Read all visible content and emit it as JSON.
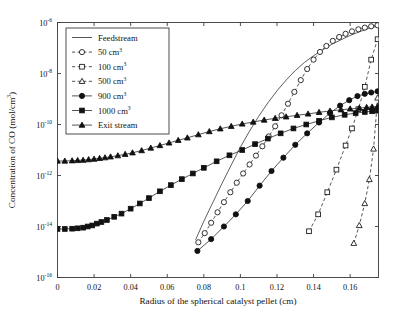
{
  "chart_data": {
    "type": "line",
    "title": "",
    "xlabel": "Radius of the spherical catalyst pellet (cm)",
    "ylabel": "Concentration of CO (mol/cm3)",
    "ylabel_base": "Concentration of CO (mol/cm",
    "ylabel_exp": "3",
    "ylabel_tail": ")",
    "xlim": [
      0,
      0.1755
    ],
    "ylim": [
      1e-16,
      1e-06
    ],
    "yscale": "log",
    "xscale": "linear",
    "grid": false,
    "legend_position": "upper-left",
    "xticks": [
      0,
      0.02,
      0.04,
      0.06,
      0.08,
      0.1,
      0.12,
      0.14,
      0.16
    ],
    "xticklabels": [
      "0",
      "0.02",
      "0.04",
      "0.06",
      "0.08",
      "0.1",
      "0.12",
      "0.14",
      "0.16"
    ],
    "yticks": [
      1e-06,
      1e-08,
      1e-10,
      1e-12,
      1e-14,
      1e-16
    ],
    "yticklabels": [
      "10-6",
      "10-8",
      "10-10",
      "10-12",
      "10-14",
      "10-16"
    ],
    "ytick_mantissa": "10",
    "ytick_exponents": [
      "-6",
      "-8",
      "-10",
      "-12",
      "-14",
      "-16"
    ],
    "series": [
      {
        "name": "Feedstream",
        "label": "Feedstream",
        "marker": "none",
        "fill": "none",
        "linestyle": "solid",
        "x": [
          0.0755,
          0.08,
          0.085,
          0.09,
          0.095,
          0.1,
          0.105,
          0.11,
          0.115,
          0.12,
          0.125,
          0.13,
          0.135,
          0.14,
          0.145,
          0.15,
          0.155,
          0.16,
          0.165,
          0.17,
          0.1755
        ],
        "y": [
          3e-15,
          1.6e-14,
          9e-14,
          5e-13,
          2.6e-12,
          1.3e-11,
          5.5e-11,
          2.1e-10,
          7e-10,
          2.1e-09,
          5.5e-09,
          1.3e-08,
          2.7e-08,
          5e-08,
          8.5e-08,
          1.4e-07,
          2.1e-07,
          3.1e-07,
          4.3e-07,
          5.8e-07,
          7.4e-07
        ]
      },
      {
        "name": "50 cm3",
        "label": "50 cm",
        "label_exp": "3",
        "marker": "circle",
        "fill": "open",
        "linestyle": "dashed",
        "x": [
          0.077,
          0.0805,
          0.084,
          0.0875,
          0.091,
          0.0945,
          0.098,
          0.1015,
          0.105,
          0.1085,
          0.112,
          0.1155,
          0.119,
          0.1225,
          0.126,
          0.1295,
          0.133,
          0.1365,
          0.14,
          0.1435,
          0.147,
          0.1505,
          0.154,
          0.1575,
          0.161,
          0.1645,
          0.168,
          0.1715,
          0.175
        ],
        "y": [
          2.4e-15,
          5.5e-15,
          1.4e-14,
          3.6e-14,
          9e-14,
          2.2e-13,
          5.2e-13,
          1.2e-12,
          2.7e-12,
          6e-12,
          1.4e-11,
          3.4e-11,
          8.5e-11,
          2.3e-10,
          6.5e-10,
          1.9e-09,
          5.5e-09,
          1.5e-08,
          3.5e-08,
          7e-08,
          1.2e-07,
          1.9e-07,
          2.7e-07,
          3.6e-07,
          4.5e-07,
          5.4e-07,
          6.3e-07,
          7.1e-07,
          7.8e-07
        ]
      },
      {
        "name": "100 cm3",
        "label": "100 cm",
        "label_exp": "3",
        "marker": "square",
        "fill": "open",
        "linestyle": "dashed",
        "x": [
          0.1375,
          0.1425,
          0.1475,
          0.1525,
          0.1575,
          0.161,
          0.1645,
          0.168,
          0.1715,
          0.175
        ],
        "y": [
          6.5e-15,
          3e-14,
          2.2e-13,
          1.7e-12,
          1.5e-11,
          7e-11,
          4e-10,
          3e-09,
          3.5e-08,
          2.2e-07
        ]
      },
      {
        "name": "500 cm3",
        "label": "500 cm",
        "label_exp": "3",
        "marker": "triangle",
        "fill": "open",
        "linestyle": "dashed",
        "x": [
          0.162,
          0.165,
          0.168,
          0.1705,
          0.1728,
          0.175
        ],
        "y": [
          2.2e-15,
          1.1e-14,
          8e-14,
          7e-13,
          1.1e-11,
          1.1e-09
        ]
      },
      {
        "name": "900 cm3",
        "label": "900 cm",
        "label_exp": "3",
        "marker": "circle",
        "fill": "filled",
        "linestyle": "solid",
        "x": [
          0.0765,
          0.084,
          0.091,
          0.0975,
          0.104,
          0.1105,
          0.117,
          0.1235,
          0.13,
          0.1365,
          0.143,
          0.149,
          0.1545,
          0.1595,
          0.164,
          0.168,
          0.1715,
          0.175
        ],
        "y": [
          1.1e-15,
          3.2e-15,
          1e-14,
          3e-14,
          1e-13,
          4e-13,
          1.5e-12,
          5e-12,
          1.6e-11,
          4.5e-11,
          1.2e-10,
          2.8e-10,
          5.5e-10,
          9e-10,
          1.3e-09,
          1.6e-09,
          1.8e-09,
          2e-09
        ]
      },
      {
        "name": "1000 cm3",
        "label": "1000 cm",
        "label_exp": "3",
        "marker": "square",
        "fill": "filled",
        "linestyle": "solid",
        "x": [
          0.0,
          0.004,
          0.008,
          0.011,
          0.014,
          0.0165,
          0.019,
          0.0215,
          0.024,
          0.027,
          0.031,
          0.035,
          0.04,
          0.045,
          0.05,
          0.056,
          0.062,
          0.068,
          0.074,
          0.08,
          0.087,
          0.094,
          0.101,
          0.108,
          0.115,
          0.122,
          0.129,
          0.136,
          0.143,
          0.15,
          0.157,
          0.163,
          0.168,
          0.172,
          0.175
        ],
        "y": [
          8e-15,
          8e-15,
          8.2e-15,
          8.5e-15,
          9e-15,
          1e-14,
          1.1e-14,
          1.3e-14,
          1.5e-14,
          1.8e-14,
          2.4e-14,
          3.2e-14,
          5e-14,
          8e-14,
          1.3e-13,
          2.4e-13,
          4.2e-13,
          7.2e-13,
          1.2e-12,
          2e-12,
          3.6e-12,
          6.2e-12,
          1e-11,
          1.7e-11,
          2.8e-11,
          4.5e-11,
          7e-11,
          1e-10,
          1.4e-10,
          1.9e-10,
          2.4e-10,
          2.8e-10,
          3.1e-10,
          3.3e-10,
          3.5e-10
        ]
      },
      {
        "name": "Exit stream",
        "label": "Exit stream",
        "marker": "triangle",
        "fill": "filled",
        "linestyle": "solid",
        "x": [
          0.0,
          0.004,
          0.008,
          0.011,
          0.014,
          0.017,
          0.02,
          0.023,
          0.026,
          0.029,
          0.033,
          0.037,
          0.041,
          0.046,
          0.051,
          0.056,
          0.061,
          0.066,
          0.071,
          0.077,
          0.083,
          0.089,
          0.095,
          0.101,
          0.107,
          0.113,
          0.119,
          0.125,
          0.131,
          0.137,
          0.143,
          0.149,
          0.155,
          0.16,
          0.165,
          0.169,
          0.172,
          0.175
        ],
        "y": [
          3.7e-12,
          3.7e-12,
          3.8e-12,
          3.9e-12,
          4e-12,
          4.2e-12,
          4.4e-12,
          4.7e-12,
          5e-12,
          5.4e-12,
          6e-12,
          6.8e-12,
          7.8e-12,
          9.5e-12,
          1.2e-11,
          1.5e-11,
          1.9e-11,
          2.4e-11,
          3e-11,
          4e-11,
          5.3e-11,
          6.8e-11,
          8.5e-11,
          1.05e-10,
          1.25e-10,
          1.5e-10,
          1.75e-10,
          2e-10,
          2.3e-10,
          2.6e-10,
          3e-10,
          3.4e-10,
          3.8e-10,
          4.1e-10,
          4.4e-10,
          4.7e-10,
          4.9e-10,
          5.1e-10
        ]
      }
    ]
  }
}
